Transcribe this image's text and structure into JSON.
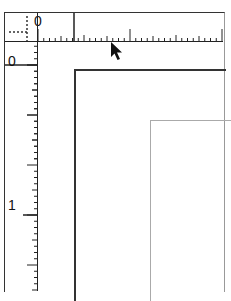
{
  "horizontal_ruler": {
    "origin_label": "0",
    "major_tick_labels": [
      "0"
    ]
  },
  "vertical_ruler": {
    "origin_label": "0",
    "major_tick_labels": [
      "0",
      "1"
    ]
  },
  "zero_point_control": {
    "icon": "crosshair-icon"
  },
  "cursor": {
    "icon": "arrow-pointer-icon"
  }
}
